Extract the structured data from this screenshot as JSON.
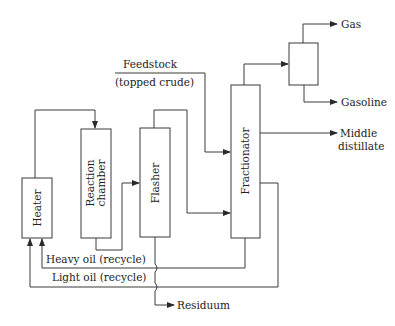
{
  "diagram": {
    "type": "process-flow",
    "colors": {
      "line": "#3a3a3a",
      "text": "#222222",
      "background": "#ffffff"
    },
    "units": [
      {
        "id": "heater",
        "label": "Heater"
      },
      {
        "id": "reaction_chamber",
        "label_line1": "Reaction",
        "label_line2": "chamber"
      },
      {
        "id": "flasher",
        "label": "Flasher"
      },
      {
        "id": "fractionator",
        "label": "Fractionator"
      },
      {
        "id": "separator",
        "label": ""
      }
    ],
    "streams": {
      "feedstock_line1": "Feedstock",
      "feedstock_line2": "(topped crude)",
      "gas": "Gas",
      "gasoline": "Gasoline",
      "middle_distillate_line1": "Middle",
      "middle_distillate_line2": "distillate",
      "heavy_oil": "Heavy oil (recycle)",
      "light_oil": "Light oil (recycle)",
      "residuum": "Residuum"
    }
  }
}
